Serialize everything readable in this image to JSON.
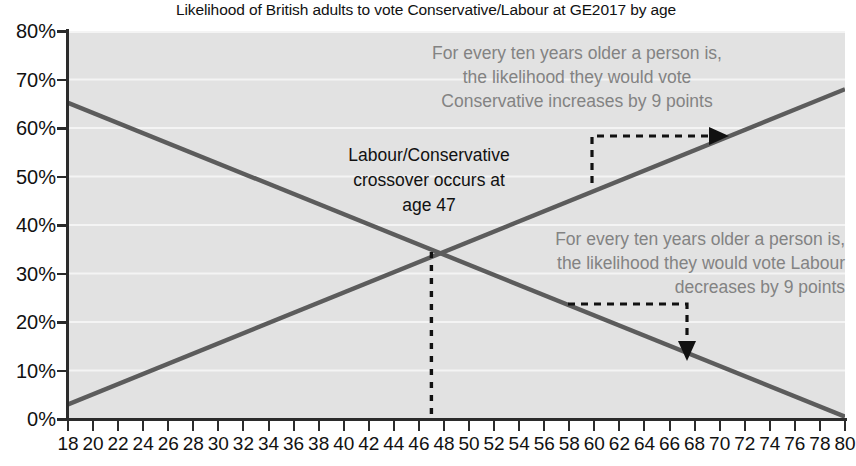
{
  "chart_data": {
    "type": "line",
    "title": "Likelihood of British adults to vote Conservative/Labour at GE2017 by age",
    "xlabel": "",
    "ylabel": "",
    "xlim": [
      18,
      80
    ],
    "ylim": [
      0,
      80
    ],
    "grid": true,
    "legend": "none",
    "x_tick_labels": [
      "18",
      "20",
      "22",
      "24",
      "26",
      "28",
      "30",
      "32",
      "34",
      "36",
      "38",
      "40",
      "42",
      "44",
      "46",
      "48",
      "50",
      "52",
      "54",
      "56",
      "58",
      "60",
      "62",
      "64",
      "66",
      "68",
      "70",
      "72",
      "74",
      "76",
      "78",
      "80"
    ],
    "y_tick_labels": [
      "0%",
      "10%",
      "20%",
      "30%",
      "40%",
      "50%",
      "60%",
      "70%",
      "80%"
    ],
    "y_tick_values": [
      0,
      10,
      20,
      30,
      40,
      50,
      60,
      70,
      80
    ],
    "series": [
      {
        "name": "Conservative",
        "color": "#5c5c5c",
        "x": [
          18,
          80
        ],
        "values": [
          3,
          68
        ],
        "slope_per_decade": 9
      },
      {
        "name": "Labour",
        "color": "#5c5c5c",
        "x": [
          18,
          80
        ],
        "values": [
          66,
          0.5
        ],
        "slope_per_decade": -9
      }
    ],
    "annotations": [
      {
        "name": "conservative-note",
        "lines": [
          "For every ten years older a person is,",
          "the likelihood they would vote",
          "Conservative increases by 9 points"
        ],
        "color": "#838383"
      },
      {
        "name": "labour-note",
        "lines": [
          "For every ten years older a person is,",
          "the likelihood they would vote Labour",
          "decreases by 9 points"
        ],
        "color": "#838383"
      },
      {
        "name": "crossover-note",
        "lines": [
          "Labour/Conservative",
          "crossover occurs at",
          "age 47"
        ],
        "color": "#111111"
      }
    ],
    "crossover": {
      "age": 47,
      "value": 34
    },
    "colors": {
      "plot_background": "#e2e2e2",
      "gridline": "#f2f2f2",
      "axis": "#2b2b2b",
      "line": "#5c5c5c",
      "annotation_grey": "#838383",
      "text": "#111111"
    }
  }
}
